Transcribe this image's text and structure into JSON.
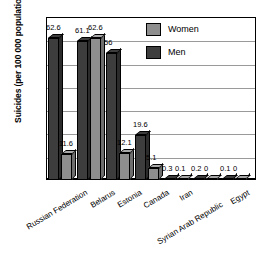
{
  "chart_data": {
    "type": "bar",
    "title": "",
    "subtitle": "",
    "xlabel": "",
    "ylabel": "Suicides (per 100 000 population)",
    "ylim": [
      0,
      70
    ],
    "ytick_step": 10,
    "yticks": [
      "70",
      "60",
      "50",
      "40",
      "30",
      "20",
      "10",
      "0"
    ],
    "ytick_values": [
      70,
      60,
      50,
      40,
      30,
      20,
      10,
      0
    ],
    "grid": true,
    "grid_axis": "y",
    "legend_position": "top-right",
    "style": "3d-column",
    "categories": [
      "Russian Federation",
      "Belarus",
      "Estonia",
      "Canada",
      "Iran",
      "Syrian Arab Republic",
      "Egypt"
    ],
    "series": [
      {
        "name": "Men",
        "color": "#3d3d3d",
        "values": [
          62.6,
          61.1,
          56,
          19.6,
          0.3,
          0.2,
          0.1
        ],
        "labels": [
          "62.6",
          "61.1",
          "56",
          "19.6",
          "0.3",
          "0.2",
          "0.1"
        ]
      },
      {
        "name": "Women",
        "color": "#8e8e8e",
        "values": [
          11.6,
          62.6,
          12.1,
          5.1,
          0.1,
          0,
          0
        ],
        "labels": [
          "11.6",
          "62.6",
          "12.1",
          "5.1",
          "0.1",
          "0",
          "0"
        ]
      }
    ]
  },
  "legend": {
    "items": [
      {
        "label": "Women",
        "color": "#8e8e8e"
      },
      {
        "label": "Men",
        "color": "#3d3d3d"
      }
    ]
  }
}
